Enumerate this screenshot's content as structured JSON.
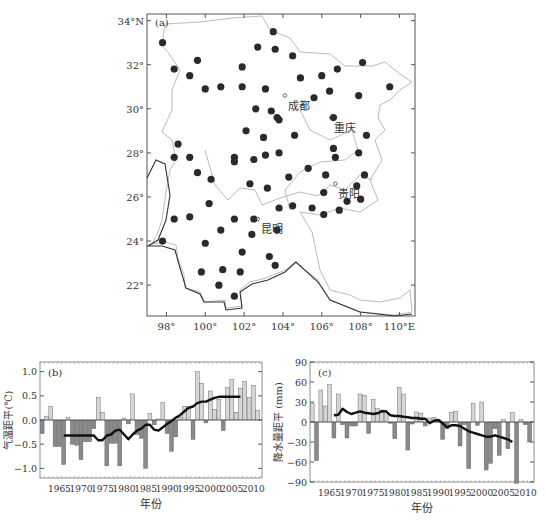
{
  "map": {
    "panel_label": "(a)",
    "lat_ticks": [
      "34°N",
      "32°",
      "30°",
      "28°",
      "26°",
      "24°",
      "22°"
    ],
    "lon_ticks": [
      "98°",
      "100°",
      "102°",
      "104°",
      "106°",
      "108°",
      "110°E"
    ],
    "cities": [
      {
        "name": "成都",
        "lon": 104.1,
        "lat": 30.6
      },
      {
        "name": "重庆",
        "lon": 106.5,
        "lat": 29.6
      },
      {
        "name": "贵阳",
        "lon": 106.7,
        "lat": 26.6
      },
      {
        "name": "昆明",
        "lon": 102.7,
        "lat": 25.0
      }
    ],
    "stations": [
      [
        97.8,
        33.0
      ],
      [
        98.4,
        31.8
      ],
      [
        99.6,
        32.2
      ],
      [
        99.2,
        31.5
      ],
      [
        100.0,
        30.9
      ],
      [
        100.8,
        31.0
      ],
      [
        101.9,
        31.0
      ],
      [
        101.9,
        31.9
      ],
      [
        102.7,
        32.8
      ],
      [
        103.5,
        33.5
      ],
      [
        103.6,
        32.7
      ],
      [
        103.1,
        30.9
      ],
      [
        104.5,
        32.4
      ],
      [
        104.9,
        31.4
      ],
      [
        106.0,
        31.5
      ],
      [
        106.8,
        31.8
      ],
      [
        108.1,
        32.1
      ],
      [
        109.5,
        31.0
      ],
      [
        107.9,
        30.6
      ],
      [
        106.4,
        30.8
      ],
      [
        105.6,
        30.5
      ],
      [
        102.6,
        30.0
      ],
      [
        103.4,
        29.9
      ],
      [
        103.8,
        29.5
      ],
      [
        103.7,
        29.6
      ],
      [
        102.1,
        29.0
      ],
      [
        103.0,
        28.7
      ],
      [
        104.6,
        28.8
      ],
      [
        106.6,
        29.6
      ],
      [
        108.3,
        28.8
      ],
      [
        106.6,
        28.2
      ],
      [
        106.7,
        27.8
      ],
      [
        107.9,
        28.0
      ],
      [
        98.6,
        28.4
      ],
      [
        98.4,
        27.8
      ],
      [
        99.2,
        27.8
      ],
      [
        99.6,
        27.1
      ],
      [
        100.3,
        26.8
      ],
      [
        101.5,
        27.8
      ],
      [
        101.5,
        27.6
      ],
      [
        102.5,
        27.7
      ],
      [
        103.1,
        27.9
      ],
      [
        103.8,
        28.0
      ],
      [
        104.3,
        26.9
      ],
      [
        105.3,
        27.3
      ],
      [
        106.2,
        27.0
      ],
      [
        108.2,
        27.0
      ],
      [
        107.8,
        26.5
      ],
      [
        106.1,
        26.2
      ],
      [
        107.3,
        25.8
      ],
      [
        108.0,
        25.9
      ],
      [
        102.3,
        26.6
      ],
      [
        103.2,
        26.4
      ],
      [
        100.2,
        25.7
      ],
      [
        98.4,
        25.0
      ],
      [
        99.2,
        25.1
      ],
      [
        101.5,
        25.0
      ],
      [
        102.5,
        25.0
      ],
      [
        103.8,
        25.5
      ],
      [
        104.5,
        25.6
      ],
      [
        105.5,
        25.5
      ],
      [
        106.1,
        25.2
      ],
      [
        106.9,
        25.4
      ],
      [
        100.8,
        24.5
      ],
      [
        102.4,
        24.3
      ],
      [
        103.7,
        24.5
      ],
      [
        97.8,
        24.0
      ],
      [
        100.0,
        23.9
      ],
      [
        101.9,
        23.5
      ],
      [
        103.3,
        23.3
      ],
      [
        103.6,
        22.9
      ],
      [
        99.8,
        22.6
      ],
      [
        100.9,
        22.7
      ],
      [
        101.8,
        22.6
      ],
      [
        100.7,
        22.0
      ],
      [
        101.5,
        21.5
      ]
    ]
  },
  "chart_data": [
    {
      "type": "bar",
      "panel_label": "(b)",
      "title": "",
      "xlabel": "年份",
      "ylabel": "气温距平(℃)",
      "ylim": [
        -1.2,
        1.2
      ],
      "yticks": [
        "1.0",
        "0.5",
        "0.0",
        "-0.5",
        "-1.0"
      ],
      "xticks": [
        "1965",
        "1970",
        "1975",
        "1980",
        "1985",
        "1990",
        "1995",
        "2000",
        "2005",
        "2010"
      ],
      "x_start": 1961,
      "values": [
        -0.28,
        0.08,
        0.28,
        -0.55,
        -0.55,
        -0.92,
        0.06,
        -0.5,
        -0.52,
        -0.82,
        -0.45,
        -0.45,
        -0.18,
        0.46,
        0.16,
        -0.95,
        -0.48,
        -0.48,
        -0.95,
        0.04,
        -0.08,
        0.54,
        -0.3,
        -0.38,
        -1.0,
        0.13,
        -0.1,
        0.02,
        0.36,
        -0.28,
        -0.65,
        -0.35,
        0.06,
        0.28,
        0.28,
        -0.4,
        1.0,
        0.76,
        -0.06,
        0.6,
        0.22,
        0.42,
        -0.22,
        0.68,
        0.84,
        0.16,
        0.66,
        0.8,
        0.46,
        0.72,
        0.2
      ],
      "series": [
        {
          "name": "running mean",
          "x_start": 1966,
          "values": [
            -0.32,
            -0.32,
            -0.32,
            -0.32,
            -0.32,
            -0.32,
            -0.32,
            -0.32,
            -0.42,
            -0.42,
            -0.32,
            -0.3,
            -0.22,
            -0.2,
            -0.3,
            -0.4,
            -0.3,
            -0.22,
            -0.18,
            -0.1,
            -0.1,
            -0.2,
            -0.22,
            -0.15,
            -0.08,
            -0.02,
            0.05,
            0.1,
            0.18,
            0.25,
            0.28,
            0.35,
            0.38,
            0.38,
            0.42,
            0.46,
            0.48,
            0.48,
            0.48,
            0.48,
            0.48,
            0.48
          ]
        }
      ],
      "colors": {
        "positive": "#d6d6d6",
        "negative": "#8a8a8a",
        "line": "#111111"
      }
    },
    {
      "type": "bar",
      "panel_label": "(c)",
      "title": "",
      "xlabel": "年份",
      "ylabel": "降水量距平 (mm)",
      "ylim": [
        -90,
        90
      ],
      "yticks": [
        "90",
        "60",
        "30",
        "0",
        "-30",
        "-60",
        "-90"
      ],
      "xticks": [
        "1965",
        "1970",
        "1975",
        "1980",
        "1985",
        "1990",
        "1995",
        "2000",
        "2005",
        "2010"
      ],
      "x_start": 1961,
      "values": [
        28,
        -58,
        48,
        24,
        56,
        -24,
        42,
        -4,
        -24,
        -6,
        -6,
        42,
        40,
        -17,
        34,
        20,
        18,
        14,
        -2,
        -25,
        52,
        42,
        -42,
        -3,
        15,
        13,
        -6,
        6,
        7,
        4,
        -26,
        -10,
        14,
        16,
        -36,
        -4,
        -70,
        28,
        -5,
        30,
        -72,
        -62,
        -10,
        -50,
        4,
        -40,
        14,
        -92,
        4,
        -4,
        -30
      ],
      "series": [
        {
          "name": "running mean",
          "x_start": 1966,
          "values": [
            10,
            11,
            20,
            15,
            12,
            14,
            16,
            14,
            13,
            12,
            13,
            16,
            16,
            10,
            9,
            9,
            8,
            7,
            6,
            6,
            5,
            5,
            -2,
            2,
            3,
            -2,
            -8,
            -5,
            -5,
            -6,
            -10,
            -14,
            -16,
            -18,
            -20,
            -22,
            -22,
            -20,
            -22,
            -24,
            -26,
            -30
          ]
        }
      ],
      "colors": {
        "positive": "#d6d6d6",
        "negative": "#8a8a8a",
        "line": "#111111"
      }
    }
  ]
}
